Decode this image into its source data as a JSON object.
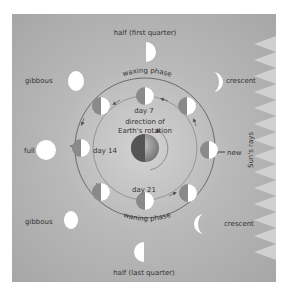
{
  "diagram": {
    "title_top": "half (first quarter)",
    "title_bottom": "half (last quarter)",
    "outer_phases": {
      "top_left": "gibbous",
      "top_right": "crescent",
      "left": "full",
      "right": "new",
      "bottom_left": "gibbous",
      "bottom_right": "crescent"
    },
    "inner_labels": {
      "day7": "day 7",
      "day14": "day 14",
      "day21": "day 21"
    },
    "arc_labels": {
      "waxing": "waxing phase",
      "waning": "waning phase"
    },
    "center_label_line1": "direction of",
    "center_label_line2": "Earth's rotation",
    "sun_label": "Sun's rays",
    "colors": {
      "panel": "#b5b5b5",
      "moon_lit": "#ffffff",
      "moon_dark": "#8a8a8a",
      "text": "#333333",
      "rays": "#d8d8d8"
    }
  }
}
